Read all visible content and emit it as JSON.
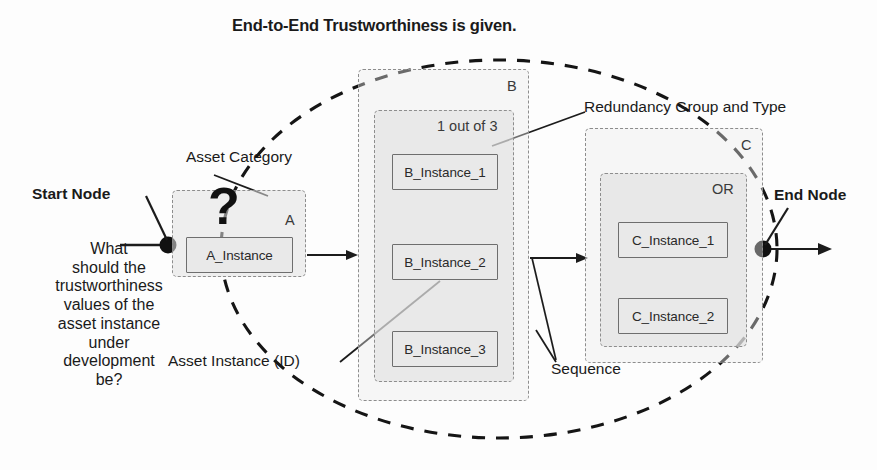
{
  "diagram": {
    "title": "End-to-End Trustworthiness is given.",
    "question_text": "What\nshould the\ntrustworthiness\nvalues of the\nasset instance\nunder\ndevelopment\nbe?",
    "unknown_marker": "?",
    "nodes": {
      "start_label": "Start Node",
      "end_label": "End Node"
    },
    "annotations": [
      {
        "id": "asset-category",
        "label": "Asset Category"
      },
      {
        "id": "asset-instance-id",
        "label": "Asset Instance (ID)"
      },
      {
        "id": "redundancy-group-and-type",
        "label": "Redundancy Group and Type"
      },
      {
        "id": "sequence",
        "label": "Sequence"
      }
    ],
    "groups": [
      {
        "id": "A",
        "category_tag": "A",
        "redundancy_tag": "",
        "instances": [
          "A_Instance"
        ]
      },
      {
        "id": "B",
        "category_tag": "B",
        "redundancy_tag": "1 out of 3",
        "instances": [
          "B_Instance_1",
          "B_Instance_2",
          "B_Instance_3"
        ]
      },
      {
        "id": "C",
        "category_tag": "C",
        "redundancy_tag": "OR",
        "instances": [
          "C_Instance_1",
          "C_Instance_2"
        ]
      }
    ],
    "colors": {
      "ink": "#1a1a1a",
      "dashed_group_border": "#8d8d8d",
      "instance_border": "#6e6e6e",
      "instance_fill": "#e9e9e9",
      "envelope_stroke": "#151515",
      "node_fill": "#111111"
    }
  }
}
